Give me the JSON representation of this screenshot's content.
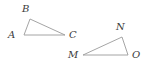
{
  "figure": {
    "background_color": "#ffffff",
    "stroke_color": "#9a9a9a",
    "label_color": "#3a3a3a",
    "stroke_width": 0.9,
    "width": 142,
    "height": 67,
    "shapes": [
      {
        "name": "triangle-abc",
        "type": "triangle",
        "vertices": [
          {
            "label": "A",
            "x": 24,
            "y": 35,
            "label_x": 8,
            "label_y": 30
          },
          {
            "label": "B",
            "x": 30,
            "y": 19,
            "label_x": 22,
            "label_y": 4
          },
          {
            "label": "C",
            "x": 65,
            "y": 35,
            "label_x": 69,
            "label_y": 30
          }
        ],
        "edges": [
          "AB",
          "BC",
          "CA"
        ]
      },
      {
        "name": "triangle-mno",
        "type": "triangle",
        "vertices": [
          {
            "label": "M",
            "x": 83,
            "y": 55,
            "label_x": 68,
            "label_y": 50
          },
          {
            "label": "N",
            "x": 122,
            "y": 37,
            "label_x": 116,
            "label_y": 22
          },
          {
            "label": "O",
            "x": 128,
            "y": 55,
            "label_x": 132,
            "label_y": 50
          }
        ],
        "edges": [
          "MN",
          "NO",
          "OM"
        ]
      }
    ]
  }
}
